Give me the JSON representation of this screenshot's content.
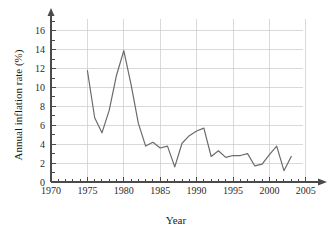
{
  "figure": {
    "name": "annual-inflation-rate-line-chart",
    "background_color": "#ffffff",
    "line_color": "#6b6b6b",
    "grid_color": "#c9c9c9",
    "axis_color": "#4a4a4a"
  },
  "axes": {
    "x_title": "Year",
    "y_title": "Annual inflation rate (%)",
    "x_tick_labels": [
      "1970",
      "1975",
      "1980",
      "1985",
      "1990",
      "1995",
      "2000",
      "2005"
    ],
    "y_tick_labels": [
      "0",
      "2",
      "4",
      "6",
      "8",
      "10",
      "12",
      "14",
      "16"
    ]
  },
  "chart_data": {
    "type": "line",
    "title": "",
    "xlabel": "Year",
    "ylabel": "Annual inflation rate (%)",
    "xlim": [
      1970,
      2005
    ],
    "ylim": [
      0,
      17
    ],
    "x_major_ticks": [
      1970,
      1975,
      1980,
      1985,
      1990,
      1995,
      2000,
      2005
    ],
    "y_major_ticks": [
      0,
      2,
      4,
      6,
      8,
      10,
      12,
      14,
      16
    ],
    "x_minor_tick_step": 1,
    "y_minor_tick_step": 1,
    "grid": true,
    "legend": "none",
    "series": [
      {
        "name": "Annual inflation rate",
        "x": [
          1975,
          1976,
          1977,
          1978,
          1979,
          1980,
          1981,
          1982,
          1983,
          1984,
          1985,
          1986,
          1987,
          1988,
          1989,
          1990,
          1991,
          1992,
          1993,
          1994,
          1995,
          1996,
          1997,
          1998,
          1999,
          2000,
          2001,
          2002,
          2003
        ],
        "values": [
          11.8,
          6.8,
          5.2,
          7.6,
          11.3,
          13.9,
          10.3,
          6.2,
          3.8,
          4.2,
          3.6,
          3.8,
          1.6,
          4.1,
          4.9,
          5.4,
          5.7,
          2.7,
          3.3,
          2.6,
          2.8,
          2.8,
          3.0,
          1.7,
          1.9,
          2.9,
          3.8,
          1.2,
          2.7
        ]
      }
    ]
  }
}
